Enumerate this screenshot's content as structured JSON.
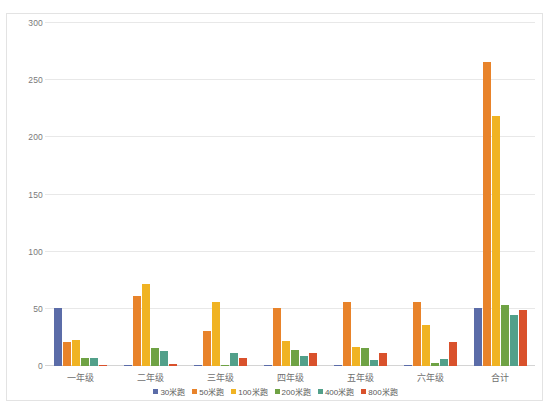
{
  "chart_data": {
    "type": "bar",
    "title": "",
    "subtitle": "",
    "xlabel": "",
    "ylabel": "",
    "ylim": [
      0,
      300
    ],
    "yticks": [
      0,
      50,
      100,
      150,
      200,
      250,
      300
    ],
    "ytick_labels": [
      "0",
      "50",
      "100",
      "150",
      "200",
      "250",
      "300"
    ],
    "grid": true,
    "legend_position": "bottom",
    "categories": [
      "一年级",
      "二年级",
      "三年级",
      "四年级",
      "五年级",
      "六年级",
      "合计"
    ],
    "series": [
      {
        "name": "30米跑",
        "color": "#5b6ca8",
        "values": [
          51,
          0,
          0,
          0,
          0,
          0,
          51
        ]
      },
      {
        "name": "50米跑",
        "color": "#e8832a",
        "values": [
          21,
          61,
          31,
          51,
          56,
          56,
          266
        ]
      },
      {
        "name": "100米跑",
        "color": "#f0b323",
        "values": [
          23,
          72,
          56,
          22,
          17,
          36,
          219
        ]
      },
      {
        "name": "200米跑",
        "color": "#6fa244",
        "values": [
          7,
          16,
          1,
          14,
          16,
          3,
          53
        ]
      },
      {
        "name": "400米跑",
        "color": "#52a08a",
        "values": [
          7,
          13,
          11,
          9,
          5,
          6,
          45
        ]
      },
      {
        "name": "800米跑",
        "color": "#d9512c",
        "values": [
          1,
          2,
          7,
          11,
          11,
          21,
          49
        ]
      }
    ]
  }
}
